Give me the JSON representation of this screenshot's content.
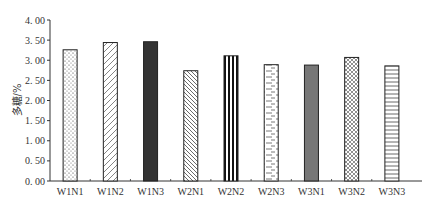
{
  "chart_data": {
    "type": "bar",
    "title": "",
    "xlabel": "",
    "ylabel": "多糖/%",
    "ylim": [
      0,
      4.0
    ],
    "yticks": [
      0.0,
      0.5,
      1.0,
      1.5,
      2.0,
      2.5,
      3.0,
      3.5,
      4.0
    ],
    "ytick_labels": [
      "0. 00",
      "0. 50",
      "1. 00",
      "1. 50",
      "2. 00",
      "2. 50",
      "3. 00",
      "3. 50",
      "4. 00"
    ],
    "grid": false,
    "legend": false,
    "categories": [
      "W1N1",
      "W1N2",
      "W1N3",
      "W2N1",
      "W2N2",
      "W2N3",
      "W3N1",
      "W3N2",
      "W3N3"
    ],
    "values": [
      3.26,
      3.44,
      3.46,
      2.74,
      3.11,
      2.89,
      2.88,
      3.07,
      2.86
    ],
    "bar_patterns": [
      "dots",
      "diagonal-right",
      "solid-dark",
      "diagonal-left",
      "vertical-stripes",
      "dashed-brick",
      "solid-gray",
      "crosshatch",
      "horizontal-lines"
    ]
  },
  "colors": {
    "axis": "#333333",
    "bar_outline": "#222222",
    "solid_dark": "#333333",
    "solid_gray": "#777777",
    "background": "#ffffff"
  }
}
